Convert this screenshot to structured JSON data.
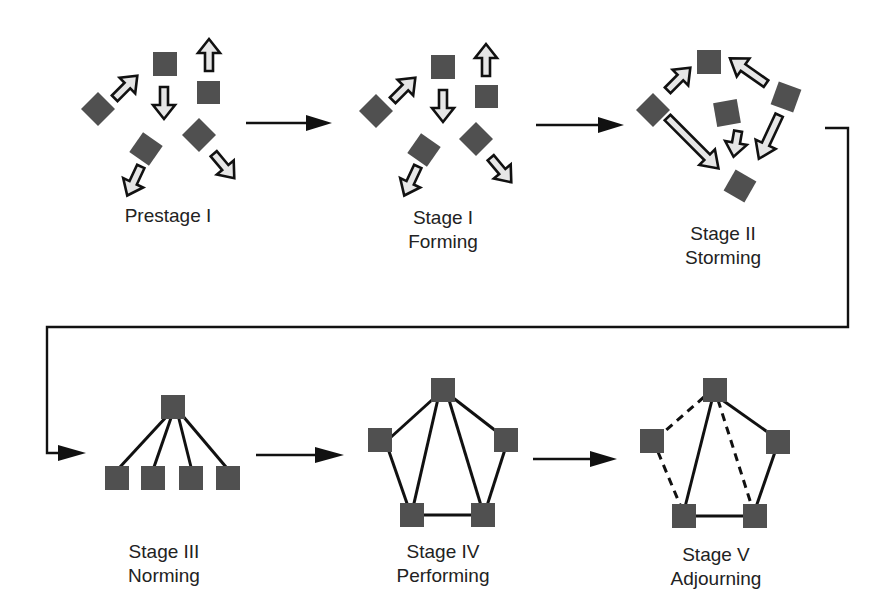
{
  "stages": [
    {
      "id": "prestage",
      "line1": "Prestage I",
      "line2": ""
    },
    {
      "id": "stage1",
      "line1": "Stage I",
      "line2": "Forming"
    },
    {
      "id": "stage2",
      "line1": "Stage II",
      "line2": "Storming"
    },
    {
      "id": "stage3",
      "line1": "Stage III",
      "line2": "Norming"
    },
    {
      "id": "stage4",
      "line1": "Stage IV",
      "line2": "Performing"
    },
    {
      "id": "stage5",
      "line1": "Stage V",
      "line2": "Adjourning"
    }
  ],
  "colors": {
    "node": "#505050",
    "arrow_fill": "#e6e6e6",
    "line": "#111111"
  }
}
